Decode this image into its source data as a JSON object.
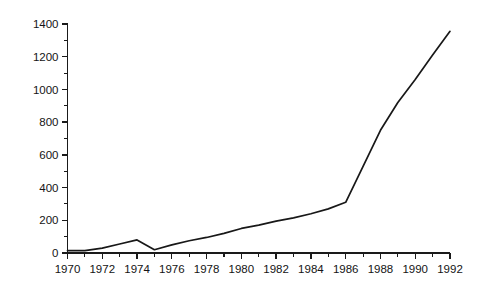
{
  "chart_data": {
    "type": "line",
    "title": "",
    "subtitle": "",
    "xlabel": "",
    "ylabel": "",
    "x": [
      1970,
      1971,
      1972,
      1973,
      1974,
      1975,
      1976,
      1977,
      1978,
      1979,
      1980,
      1981,
      1982,
      1983,
      1984,
      1985,
      1986,
      1987,
      1988,
      1989,
      1990,
      1991,
      1992
    ],
    "values": [
      15,
      15,
      30,
      55,
      80,
      20,
      50,
      75,
      95,
      120,
      150,
      170,
      195,
      215,
      240,
      270,
      310,
      530,
      750,
      920,
      1060,
      1210,
      1355
    ],
    "series": [
      {
        "name": "series-1",
        "values": [
          15,
          15,
          30,
          55,
          80,
          20,
          50,
          75,
          95,
          120,
          150,
          170,
          195,
          215,
          240,
          270,
          310,
          530,
          750,
          920,
          1060,
          1210,
          1355
        ]
      }
    ],
    "xlim": [
      1970,
      1992
    ],
    "ylim": [
      0,
      1400
    ],
    "y_major_ticks": [
      0,
      200,
      400,
      600,
      800,
      1000,
      1200,
      1400
    ],
    "y_minor_ticks": [
      100,
      300,
      500,
      700,
      900,
      1100,
      1300
    ],
    "y_tick_labels": [
      "0",
      "200",
      "400",
      "600",
      "800",
      "1000",
      "1200",
      "1400"
    ],
    "x_major_ticks": [
      1970,
      1972,
      1974,
      1976,
      1978,
      1980,
      1982,
      1984,
      1986,
      1988,
      1990,
      1992
    ],
    "x_minor_ticks": [
      1971,
      1973,
      1975,
      1977,
      1979,
      1981,
      1983,
      1985,
      1987,
      1989,
      1991
    ],
    "x_tick_labels": [
      "1970",
      "1972",
      "1974",
      "1976",
      "1978",
      "1980",
      "1982",
      "1984",
      "1986",
      "1988",
      "1990",
      "1992"
    ],
    "grid": false,
    "legend": false,
    "legend_position": "none",
    "annotations": [],
    "line_color": "#181818",
    "axis_color": "#1a1a1a",
    "background_color": "#ffffff"
  }
}
